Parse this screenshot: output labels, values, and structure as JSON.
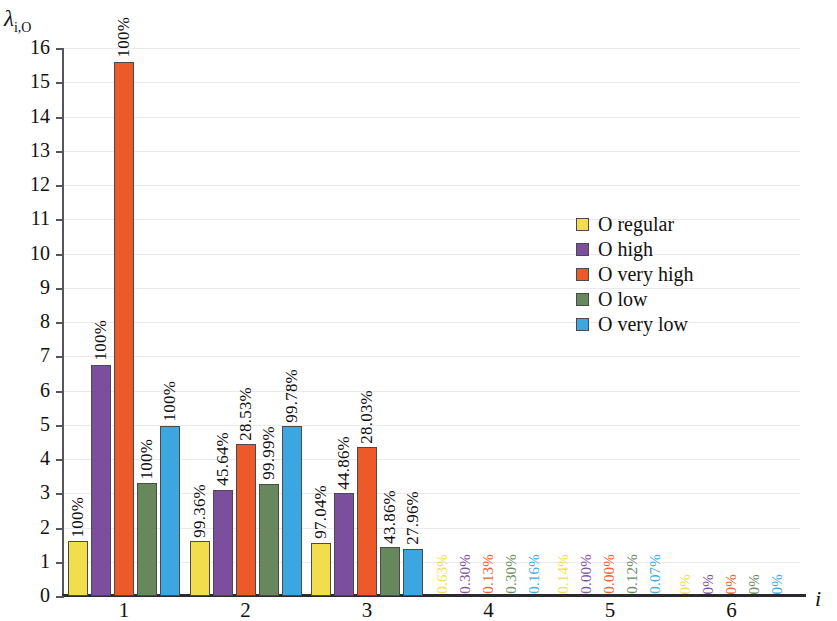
{
  "chart_data": {
    "type": "bar",
    "title": "",
    "xlabel": "i",
    "ylabel": "λ",
    "ylabel_sub": "i,O",
    "ylim": [
      0,
      16
    ],
    "ytick_labels": [
      "0",
      "1",
      "2",
      "3",
      "4",
      "5",
      "6",
      "7",
      "8",
      "9",
      "10",
      "11",
      "12",
      "13",
      "14",
      "15",
      "16"
    ],
    "categories": [
      "1",
      "2",
      "3",
      "4",
      "5",
      "6"
    ],
    "grid": true,
    "legend_position": "center-right",
    "series": [
      {
        "name": "O regular",
        "color": "#F2DE4C",
        "values": [
          1.6,
          1.6,
          1.55,
          0.0,
          0.0,
          0.0
        ],
        "labels": [
          "100%",
          "99.36%",
          "97.04%",
          "0.63%",
          "0.14%",
          "0%"
        ]
      },
      {
        "name": "O high",
        "color": "#7B4E9E",
        "values": [
          6.75,
          3.1,
          3.0,
          0.0,
          0.0,
          0.0
        ],
        "labels": [
          "100%",
          "45.64%",
          "44.86%",
          "0.30%",
          "0.00%",
          "0%"
        ]
      },
      {
        "name": "O very high",
        "color": "#ED5A2A",
        "values": [
          15.6,
          4.43,
          4.34,
          0.0,
          0.0,
          0.0
        ],
        "labels": [
          "100%",
          "28.53%",
          "28.03%",
          "0.13%",
          "0.00%",
          "0%"
        ]
      },
      {
        "name": "O low",
        "color": "#67875C",
        "values": [
          3.3,
          3.27,
          1.42,
          0.0,
          0.0,
          0.0
        ],
        "labels": [
          "100%",
          "99.99%",
          "43.86%",
          "0.30%",
          "0.12%",
          "0%"
        ]
      },
      {
        "name": "O very low",
        "color": "#3BA6E0",
        "values": [
          4.97,
          4.96,
          1.38,
          0.0,
          0.0,
          0.0
        ],
        "labels": [
          "100%",
          "99.78%",
          "27.96%",
          "0.16%",
          "0.07%",
          "0%"
        ]
      }
    ]
  },
  "legend": {
    "items": [
      {
        "label": "O regular",
        "color": "#F2DE4C"
      },
      {
        "label": "O high",
        "color": "#7B4E9E"
      },
      {
        "label": "O very high",
        "color": "#ED5A2A"
      },
      {
        "label": "O low",
        "color": "#67875C"
      },
      {
        "label": "O very low",
        "color": "#3BA6E0"
      }
    ]
  }
}
